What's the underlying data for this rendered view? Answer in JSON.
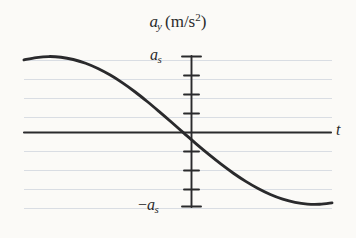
{
  "figure": {
    "background_color": "#fbfaf7",
    "ink_color": "#2a2a2c",
    "gridline_color": "#d9dde3",
    "axis_title": {
      "quantity": "a",
      "quantity_subscript": "y",
      "open_paren": "(",
      "units": "m/s",
      "units_exponent": "2",
      "close_paren": ")",
      "plain": "a_y (m/s^2)"
    },
    "y_axis": {
      "top_label_text": "a",
      "top_label_subscript": "s",
      "bottom_label_minus": "−",
      "bottom_label_text": "a",
      "bottom_label_subscript": "s",
      "top_label_plain": "a_s",
      "bottom_label_plain": "-a_s"
    },
    "x_axis": {
      "label": "t"
    }
  },
  "chart_data": {
    "type": "line",
    "xlabel": "t",
    "ylabel": "a_y",
    "grid": true,
    "legend": false,
    "xlim": [
      0,
      1
    ],
    "ylim": [
      -1,
      1
    ],
    "ytick_labels": [
      "a_s",
      "-a_s"
    ],
    "ytick_values": [
      1,
      -1
    ],
    "xtick_labels": [],
    "annotations": [
      "a_s",
      "-a_s",
      "t"
    ],
    "series": [
      {
        "name": "a_y(t)",
        "color": "#2a2a2c",
        "x": [
          0.0,
          0.04,
          0.08,
          0.12,
          0.16,
          0.2,
          0.24,
          0.28,
          0.32,
          0.36,
          0.4,
          0.44,
          0.48,
          0.52,
          0.56,
          0.6,
          0.64,
          0.68,
          0.72,
          0.76,
          0.8,
          0.84,
          0.88,
          0.92,
          0.96,
          1.0
        ],
        "y": [
          0.955,
          0.985,
          0.999,
          0.99,
          0.96,
          0.91,
          0.84,
          0.752,
          0.648,
          0.53,
          0.4,
          0.262,
          0.12,
          -0.025,
          -0.168,
          -0.305,
          -0.435,
          -0.556,
          -0.665,
          -0.76,
          -0.84,
          -0.902,
          -0.945,
          -0.968,
          -0.97,
          -0.952
        ]
      }
    ],
    "gridlines_y_px": [
      60,
      79,
      98,
      117,
      151,
      170,
      189,
      208
    ]
  }
}
